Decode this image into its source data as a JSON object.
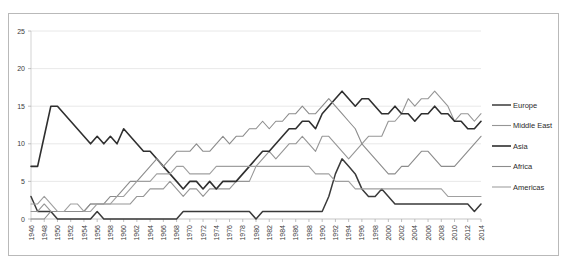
{
  "chart_data": {
    "type": "line",
    "title": "",
    "subtitle": "",
    "xlabel": "",
    "ylabel": "",
    "xlim": [
      1946,
      2014
    ],
    "ylim": [
      0,
      25
    ],
    "yticks": [
      0,
      5,
      10,
      15,
      20,
      25
    ],
    "ytick_labels": [
      "0",
      "5",
      "10",
      "15",
      "20",
      "25"
    ],
    "grid": true,
    "grid_axis": "y",
    "legend_position": "right",
    "x": [
      1946,
      1947,
      1948,
      1949,
      1950,
      1951,
      1952,
      1953,
      1954,
      1955,
      1956,
      1957,
      1958,
      1959,
      1960,
      1961,
      1962,
      1963,
      1964,
      1965,
      1966,
      1967,
      1968,
      1969,
      1970,
      1971,
      1972,
      1973,
      1974,
      1975,
      1976,
      1977,
      1978,
      1979,
      1980,
      1981,
      1982,
      1983,
      1984,
      1985,
      1986,
      1987,
      1988,
      1989,
      1990,
      1991,
      1992,
      1993,
      1994,
      1995,
      1996,
      1997,
      1998,
      1999,
      2000,
      2001,
      2002,
      2003,
      2004,
      2005,
      2006,
      2007,
      2008,
      2009,
      2010,
      2011,
      2012,
      2013,
      2014
    ],
    "xtick_labels": [
      "1946",
      "1948",
      "1950",
      "1952",
      "1954",
      "1956",
      "1958",
      "1960",
      "1962",
      "1964",
      "1966",
      "1968",
      "1970",
      "1972",
      "1974",
      "1976",
      "1978",
      "1980",
      "1982",
      "1984",
      "1986",
      "1988",
      "1990",
      "1992",
      "1994",
      "1996",
      "1998",
      "2000",
      "2002",
      "2004",
      "2006",
      "2008",
      "2010",
      "2012",
      "2014"
    ],
    "series": [
      {
        "name": "Europe",
        "color": "#3a3a3a",
        "width": 1.5,
        "values": [
          3,
          1,
          1,
          1,
          0,
          0,
          0,
          0,
          0,
          0,
          1,
          0,
          0,
          0,
          0,
          0,
          0,
          0,
          0,
          0,
          0,
          0,
          0,
          1,
          1,
          1,
          1,
          1,
          1,
          1,
          1,
          1,
          1,
          1,
          0,
          1,
          1,
          1,
          1,
          1,
          1,
          1,
          1,
          1,
          1,
          3,
          6,
          8,
          7,
          6,
          4,
          3,
          3,
          4,
          3,
          2,
          2,
          2,
          2,
          2,
          2,
          2,
          2,
          2,
          2,
          2,
          2,
          1,
          2
        ]
      },
      {
        "name": "Middle East",
        "color": "#969696",
        "width": 1.1,
        "values": [
          1,
          1,
          2,
          1,
          1,
          1,
          1,
          1,
          1,
          2,
          2,
          2,
          2,
          2,
          2,
          2,
          3,
          3,
          4,
          4,
          4,
          5,
          4,
          3,
          4,
          4,
          3,
          4,
          4,
          4,
          4,
          5,
          5,
          5,
          7,
          8,
          9,
          8,
          9,
          10,
          10,
          11,
          10,
          9,
          11,
          11,
          10,
          9,
          8,
          9,
          10,
          11,
          11,
          11,
          13,
          13,
          14,
          16,
          15,
          16,
          16,
          17,
          16,
          15,
          13,
          14,
          14,
          13,
          14
        ]
      },
      {
        "name": "Asia",
        "color": "#2f2f2f",
        "width": 1.6,
        "values": [
          7,
          7,
          11,
          15,
          15,
          14,
          13,
          12,
          11,
          10,
          11,
          10,
          11,
          10,
          12,
          11,
          10,
          9,
          9,
          8,
          7,
          6,
          5,
          4,
          5,
          5,
          4,
          5,
          4,
          5,
          5,
          5,
          6,
          7,
          8,
          9,
          9,
          10,
          11,
          12,
          12,
          13,
          13,
          12,
          14,
          15,
          16,
          17,
          16,
          15,
          16,
          16,
          15,
          14,
          14,
          15,
          14,
          14,
          13,
          14,
          14,
          15,
          14,
          14,
          13,
          13,
          12,
          12,
          13
        ]
      },
      {
        "name": "Africa",
        "color": "#8c8c8c",
        "width": 1.1,
        "values": [
          0,
          0,
          0,
          1,
          1,
          1,
          1,
          1,
          1,
          2,
          2,
          2,
          3,
          3,
          4,
          5,
          5,
          6,
          7,
          8,
          7,
          8,
          9,
          9,
          9,
          10,
          9,
          9,
          10,
          11,
          10,
          11,
          11,
          12,
          12,
          13,
          12,
          13,
          13,
          14,
          14,
          15,
          14,
          14,
          15,
          16,
          15,
          14,
          13,
          12,
          10,
          9,
          8,
          7,
          6,
          6,
          7,
          7,
          8,
          9,
          9,
          8,
          7,
          7,
          7,
          8,
          9,
          10,
          11
        ]
      },
      {
        "name": "Americas",
        "color": "#a0a0a0",
        "width": 1.1,
        "values": [
          2,
          2,
          3,
          2,
          1,
          1,
          2,
          2,
          1,
          1,
          2,
          2,
          2,
          3,
          3,
          4,
          5,
          5,
          5,
          6,
          6,
          6,
          7,
          7,
          6,
          6,
          6,
          6,
          7,
          7,
          7,
          7,
          7,
          7,
          7,
          7,
          7,
          7,
          7,
          7,
          7,
          7,
          7,
          6,
          6,
          6,
          5,
          5,
          5,
          4,
          4,
          4,
          4,
          4,
          4,
          4,
          4,
          4,
          4,
          4,
          4,
          4,
          4,
          3,
          3,
          3,
          3,
          3,
          3
        ]
      }
    ]
  },
  "legend": {
    "entries": [
      {
        "label": "Europe"
      },
      {
        "label": "Middle East"
      },
      {
        "label": "Asia"
      },
      {
        "label": "Africa"
      },
      {
        "label": "Americas"
      }
    ]
  }
}
